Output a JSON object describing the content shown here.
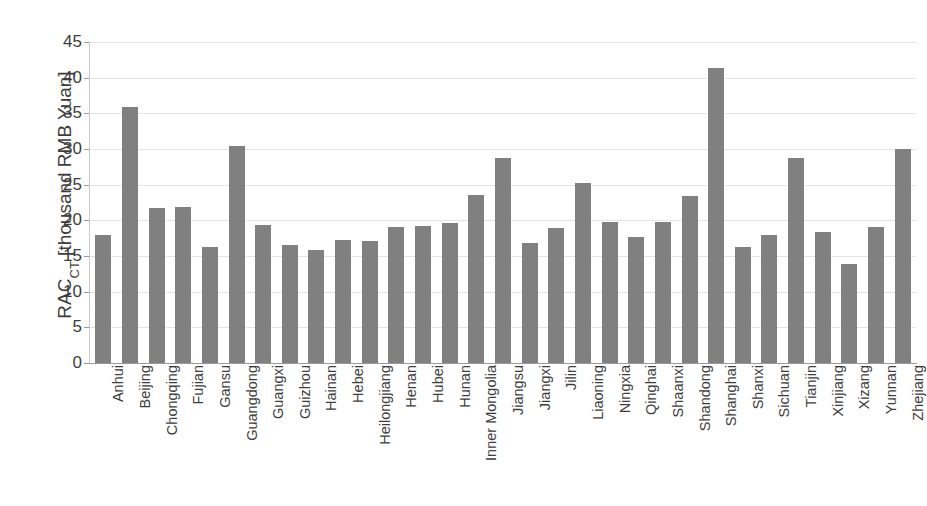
{
  "chart_data": {
    "type": "bar",
    "title": "",
    "subtitle": "",
    "xlabel": "",
    "ylabel": "RAC_CT [thousand RMB Yuan]",
    "ylabel_main": "RAC",
    "ylabel_subscript": "CT",
    "ylabel_unit": " [thousand RMB Yuan]",
    "ylim": [
      0,
      45
    ],
    "yticks": [
      0,
      5,
      10,
      15,
      20,
      25,
      30,
      35,
      40,
      45
    ],
    "ytick_labels": [
      "0",
      "5",
      "10",
      "15",
      "20",
      "25",
      "30",
      "35",
      "40",
      "45"
    ],
    "grid": true,
    "grid_axis": "y",
    "legend": null,
    "bar_color": "#808080",
    "categories": [
      "Anhui",
      "Beijing",
      "Chongqing",
      "Fujian",
      "Gansu",
      "Guangdong",
      "Guangxi",
      "Guizhou",
      "Hainan",
      "Hebei",
      "Heilongjiang",
      "Henan",
      "Hubei",
      "Hunan",
      "Inner Mongolia",
      "Jiangsu",
      "Jiangxi",
      "Jilin",
      "Liaoning",
      "Ningxia",
      "Qinghai",
      "Shaanxi",
      "Shandong",
      "Shanghai",
      "Shanxi",
      "Sichuan",
      "Tianjin",
      "Xinjiang",
      "Xizang",
      "Yunnan",
      "Zhejiang"
    ],
    "values": [
      17.9,
      35.9,
      21.8,
      21.9,
      16.3,
      30.4,
      19.4,
      16.6,
      15.9,
      17.3,
      17.1,
      19.1,
      19.2,
      19.6,
      23.6,
      28.8,
      16.8,
      18.9,
      25.2,
      19.8,
      17.7,
      19.8,
      23.4,
      41.3,
      16.3,
      18.0,
      28.8,
      18.3,
      13.9,
      19.1,
      30.0
    ]
  }
}
